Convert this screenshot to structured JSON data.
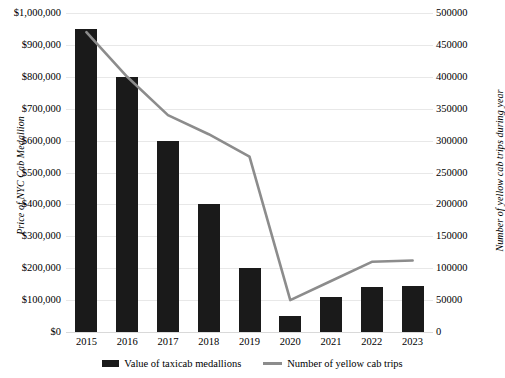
{
  "chart_data": {
    "type": "bar",
    "title": "",
    "xlabel": "",
    "ylabel": "Price of NYC Cab Medallion",
    "y2label": "Number of yellow cab trips during year",
    "categories": [
      "2015",
      "2016",
      "2017",
      "2018",
      "2019",
      "2020",
      "2021",
      "2022",
      "2023"
    ],
    "ylim": [
      0,
      1000000
    ],
    "y2lim": [
      0,
      500000
    ],
    "grid": true,
    "legend_position": "bottom",
    "y_ticks": [
      "$0",
      "$100,000",
      "$200,000",
      "$300,000",
      "$400,000",
      "$500,000",
      "$600,000",
      "$700,000",
      "$800,000",
      "$900,000",
      "$1,000,000"
    ],
    "y_tick_values": [
      0,
      100000,
      200000,
      300000,
      400000,
      500000,
      600000,
      700000,
      800000,
      900000,
      1000000
    ],
    "y2_ticks": [
      "0",
      "50000",
      "100000",
      "150000",
      "200000",
      "250000",
      "300000",
      "350000",
      "400000",
      "450000",
      "500000"
    ],
    "y2_tick_values": [
      0,
      50000,
      100000,
      150000,
      200000,
      250000,
      300000,
      350000,
      400000,
      450000,
      500000
    ],
    "series": [
      {
        "name": "Value of taxicab medallions",
        "type": "bar",
        "axis": "left",
        "color": "#1a1a1a",
        "values": [
          950000,
          800000,
          600000,
          400000,
          200000,
          50000,
          110000,
          140000,
          145000
        ]
      },
      {
        "name": "Number of yellow cab trips",
        "type": "line",
        "axis": "right",
        "color": "#8c8c8c",
        "values": [
          470000,
          400000,
          340000,
          310000,
          275000,
          50000,
          80000,
          110000,
          112000
        ]
      }
    ]
  },
  "legend": {
    "items": [
      {
        "label": "Value of taxicab medallions",
        "swatch": "bar-swatch"
      },
      {
        "label": "Number of yellow cab trips",
        "swatch": "line-swatch"
      }
    ]
  }
}
